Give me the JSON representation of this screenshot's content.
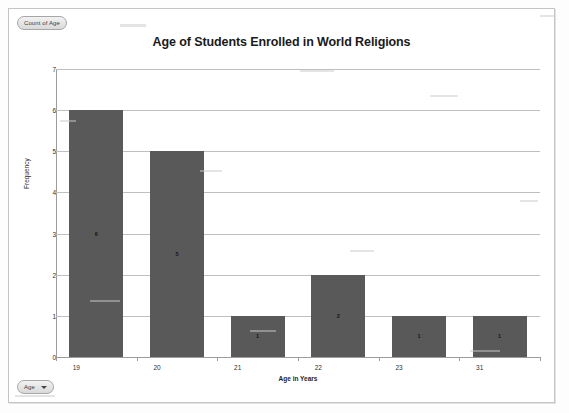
{
  "window": {
    "pivot_value_button": "Count of Age",
    "pivot_field_button": "Age",
    "dropdown_icon": "chevron-down-icon"
  },
  "chart_data": {
    "type": "bar",
    "title": "Age of Students Enrolled in World Religions",
    "xlabel": "Age in Years",
    "ylabel": "Frequency",
    "categories": [
      "19",
      "20",
      "21",
      "22",
      "23",
      "31"
    ],
    "values": [
      6,
      5,
      1,
      2,
      1,
      1
    ],
    "data_labels": [
      "6",
      "5",
      "1",
      "2",
      "1",
      "1"
    ],
    "ylim": [
      0,
      7
    ],
    "ytick_step": 1,
    "yticks": [
      "0",
      "1",
      "2",
      "3",
      "4",
      "5",
      "6",
      "7"
    ],
    "grid": "horizontal",
    "legend": "none",
    "series_color": "#595959",
    "gridline_color": "#BFBFBF",
    "plot_background": "#FFFFFF"
  }
}
